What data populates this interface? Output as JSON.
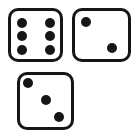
{
  "canvas": {
    "width": 139,
    "height": 139,
    "background": "#ffffff"
  },
  "colors": {
    "die_face": "#ffffff",
    "die_border": "#161616",
    "pip": "#161616"
  },
  "pip_diameter": 10,
  "dice": [
    {
      "name": "die-six",
      "value": 6,
      "x": 8,
      "y": 8,
      "w": 55,
      "h": 54,
      "pips": [
        [
          23,
          25
        ],
        [
          23,
          53
        ],
        [
          23,
          82
        ],
        [
          79,
          25
        ],
        [
          79,
          53
        ],
        [
          79,
          82
        ]
      ]
    },
    {
      "name": "die-two",
      "value": 2,
      "x": 72,
      "y": 8,
      "w": 59,
      "h": 54,
      "pips": [
        [
          21,
          23
        ],
        [
          70,
          77
        ]
      ]
    },
    {
      "name": "die-three",
      "value": 3,
      "x": 17,
      "y": 72,
      "w": 57,
      "h": 58,
      "pips": [
        [
          15,
          16
        ],
        [
          50,
          49
        ],
        [
          77,
          80
        ]
      ]
    }
  ]
}
